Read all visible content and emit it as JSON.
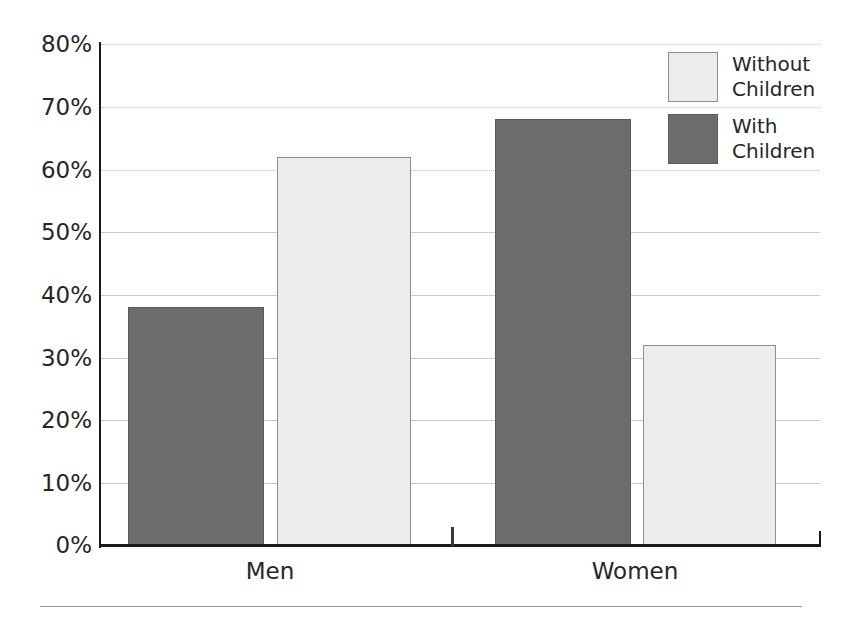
{
  "chart_data": {
    "type": "bar",
    "title": "",
    "subtitle": "",
    "xlabel": "",
    "ylabel": "",
    "categories": [
      "Men",
      "Women"
    ],
    "series": [
      {
        "name": "With Children",
        "values": [
          38,
          68
        ],
        "color": "#6c6c6c"
      },
      {
        "name": "Without Children",
        "values": [
          62,
          32
        ],
        "color": "#ececec"
      }
    ],
    "ylim": [
      0,
      80
    ],
    "ytick_values": [
      0,
      10,
      20,
      30,
      40,
      50,
      60,
      70,
      80
    ],
    "ytick_labels": [
      "0%",
      "10%",
      "20%",
      "30%",
      "40%",
      "50%",
      "60%",
      "70%",
      "80%"
    ],
    "grid": true,
    "grid_axis": "y",
    "legend_position": "top-right",
    "bar_order_within_group": [
      "With Children",
      "Without Children"
    ],
    "value_format": "percent"
  },
  "axis": {
    "y_ticks": [
      {
        "label": "80%",
        "value": 80
      },
      {
        "label": "70%",
        "value": 70
      },
      {
        "label": "60%",
        "value": 60
      },
      {
        "label": "50%",
        "value": 50
      },
      {
        "label": "40%",
        "value": 40
      },
      {
        "label": "30%",
        "value": 30
      },
      {
        "label": "20%",
        "value": 20
      },
      {
        "label": "10%",
        "value": 10
      },
      {
        "label": "0%",
        "value": 0
      }
    ],
    "x_categories": [
      {
        "label": "Men"
      },
      {
        "label": "Women"
      }
    ]
  },
  "legend": {
    "items": [
      {
        "line1": "Without",
        "line2": "Children",
        "swatch": "light-swatch-icon"
      },
      {
        "line1": "With",
        "line2": "Children",
        "swatch": "dark-swatch-icon"
      }
    ]
  },
  "bars": [
    {
      "group": "Men",
      "series": "With Children",
      "value": 38,
      "label": "38%",
      "style": "dark"
    },
    {
      "group": "Men",
      "series": "Without Children",
      "value": 62,
      "label": "62%",
      "style": "light"
    },
    {
      "group": "Women",
      "series": "With Children",
      "value": 68,
      "label": "68%",
      "style": "dark"
    },
    {
      "group": "Women",
      "series": "Without Children",
      "value": 32,
      "label": "32%",
      "style": "light"
    }
  ],
  "colors": {
    "with_children": "#6c6c6c",
    "without_children": "#ececec",
    "axis": "#1b1b1b",
    "gridline": "#c9c9c9",
    "text": "#262626"
  }
}
